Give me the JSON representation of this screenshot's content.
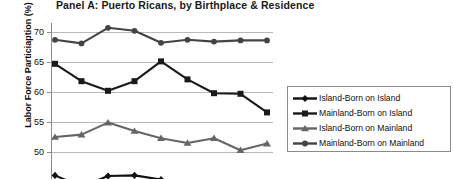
{
  "chart_data": {
    "type": "line",
    "title": "Panel A: Puerto Ricans, by Birthplace & Residence",
    "xlabel": "",
    "ylabel": "Labor Force Particiaption (%)",
    "ylim": [
      43.5,
      71.5
    ],
    "yticks": [
      45,
      50,
      55,
      60,
      65,
      70
    ],
    "ytick_labels": [
      "45",
      "50",
      "55",
      "60",
      "65",
      "70"
    ],
    "grid": true,
    "legend_position": "right",
    "x": [
      1,
      2,
      3,
      4,
      5,
      6,
      7,
      8,
      9
    ],
    "note": "bottom of figure is cropped; x-axis category labels are not visible",
    "series": [
      {
        "name": "Island-Born on Island",
        "marker": "diamond",
        "color": "#111111",
        "values": [
          46.1,
          44.2,
          46.0,
          46.1,
          45.4,
          44.9,
          44.0,
          43.8,
          43.6
        ]
      },
      {
        "name": "Mainland-Born on Island",
        "marker": "square",
        "color": "#1a1a1a",
        "values": [
          64.7,
          61.8,
          60.2,
          61.8,
          65.1,
          62.1,
          59.8,
          59.7,
          56.6
        ]
      },
      {
        "name": "Island-Born on Mainland",
        "marker": "triangle",
        "color": "#666666",
        "values": [
          52.5,
          52.9,
          54.9,
          53.5,
          52.3,
          51.5,
          52.3,
          50.3,
          51.4
        ]
      },
      {
        "name": "Mainland-Born on Mainland",
        "marker": "circle",
        "color": "#444444",
        "values": [
          68.7,
          68.1,
          70.7,
          70.2,
          68.2,
          68.7,
          68.4,
          68.6,
          68.6
        ]
      }
    ]
  },
  "legend": {
    "items": [
      {
        "label": "Island-Born on Island",
        "marker": "diamond",
        "color": "#111111"
      },
      {
        "label": "Mainland-Born on Island",
        "marker": "square",
        "color": "#1a1a1a"
      },
      {
        "label": "Island-Born on Mainland",
        "marker": "triangle",
        "color": "#666666"
      },
      {
        "label": "Mainland-Born on Mainland",
        "marker": "circle",
        "color": "#444444"
      }
    ]
  }
}
